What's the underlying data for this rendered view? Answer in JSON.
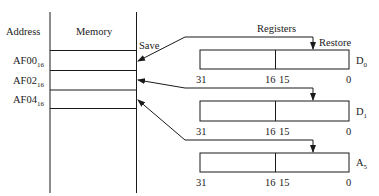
{
  "memory": {
    "column_header_address": "Address",
    "column_header_memory": "Memory",
    "save_label": "Save",
    "addresses": [
      {
        "base": "AF00",
        "radix": "16"
      },
      {
        "base": "AF02",
        "radix": "16"
      },
      {
        "base": "AF04",
        "radix": "16"
      }
    ]
  },
  "registers": {
    "title": "Registers",
    "restore_label": "Restore",
    "items": [
      {
        "name": "D",
        "sub": "0",
        "bits": {
          "msb": "31",
          "mid_hi": "16",
          "mid_lo": "15",
          "lsb": "0"
        }
      },
      {
        "name": "D",
        "sub": "1",
        "bits": {
          "msb": "31",
          "mid_hi": "16",
          "mid_lo": "15",
          "lsb": "0"
        }
      },
      {
        "name": "A",
        "sub": "5",
        "bits": {
          "msb": "31",
          "mid_hi": "16",
          "mid_lo": "15",
          "lsb": "0"
        }
      }
    ]
  },
  "colors": {
    "line": "#1a1a1a",
    "background": "#ffffff"
  }
}
